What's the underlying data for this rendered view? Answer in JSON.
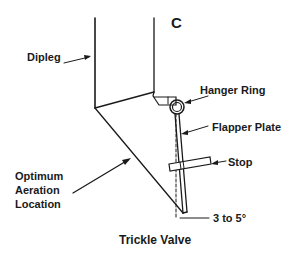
{
  "diagram": {
    "title": "Trickle Valve",
    "corner_label": "C",
    "labels": {
      "dipleg": "Dipleg",
      "hanger_ring": "Hanger Ring",
      "flapper_plate": "Flapper Plate",
      "stop": "Stop",
      "optimum_line1": "Optimum",
      "optimum_line2": "Aeration",
      "optimum_line3": "Location",
      "angle": "3 to 5°"
    },
    "colors": {
      "line": "#1a1a1a",
      "background": "#ffffff"
    }
  }
}
